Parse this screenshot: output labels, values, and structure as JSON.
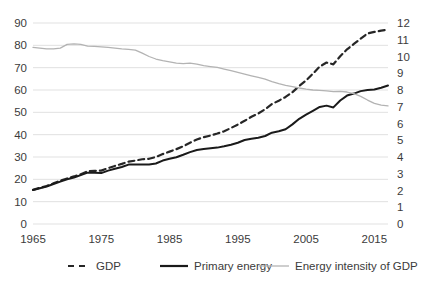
{
  "chart_data": {
    "type": "line",
    "title": "",
    "xlabel": "",
    "ylabel": "",
    "y2label": "",
    "grid": true,
    "legend_position": "bottom",
    "xlim": [
      1965,
      2017
    ],
    "ylim": [
      0,
      90
    ],
    "y2lim": [
      0,
      12
    ],
    "x_ticks": [
      "1965",
      "1975",
      "1985",
      "1995",
      "2005",
      "2015"
    ],
    "x_tick_values": [
      1965,
      1975,
      1985,
      1995,
      2005,
      2015
    ],
    "y_ticks": [
      "0",
      "10",
      "20",
      "30",
      "40",
      "50",
      "60",
      "70",
      "80",
      "90"
    ],
    "y_tick_values": [
      0,
      10,
      20,
      30,
      40,
      50,
      60,
      70,
      80,
      90
    ],
    "y2_ticks": [
      "0",
      "1",
      "2",
      "3",
      "4",
      "5",
      "6",
      "7",
      "8",
      "9",
      "10",
      "11",
      "12"
    ],
    "y2_tick_values": [
      0,
      1,
      2,
      3,
      4,
      5,
      6,
      7,
      8,
      9,
      10,
      11,
      12
    ],
    "x": [
      1965,
      1966,
      1967,
      1968,
      1969,
      1970,
      1971,
      1972,
      1973,
      1974,
      1975,
      1976,
      1977,
      1978,
      1979,
      1980,
      1981,
      1982,
      1983,
      1984,
      1985,
      1986,
      1987,
      1988,
      1989,
      1990,
      1991,
      1992,
      1993,
      1994,
      1995,
      1996,
      1997,
      1998,
      1999,
      2000,
      2001,
      2002,
      2003,
      2004,
      2005,
      2006,
      2007,
      2008,
      2009,
      2010,
      2011,
      2012,
      2013,
      2014,
      2015,
      2016,
      2017
    ],
    "series": [
      {
        "name": "GDP",
        "axis": "left",
        "style": "dashed",
        "color": "#262626",
        "values": [
          15.3,
          16.2,
          17.0,
          18.2,
          19.4,
          20.4,
          21.3,
          22.3,
          23.6,
          23.8,
          23.9,
          25.0,
          26.0,
          26.9,
          27.9,
          28.4,
          29.0,
          29.2,
          30.0,
          31.3,
          32.4,
          33.5,
          34.8,
          36.4,
          37.8,
          38.9,
          39.6,
          40.5,
          41.5,
          43.0,
          44.5,
          46.2,
          48.0,
          49.5,
          51.4,
          53.7,
          55.2,
          56.9,
          59.0,
          61.8,
          64.3,
          67.3,
          70.5,
          72.3,
          71.5,
          75.1,
          78.2,
          80.6,
          83.0,
          85.3,
          86.0,
          86.6,
          87.0
        ]
      },
      {
        "name": "Primary energy",
        "axis": "left",
        "style": "solid",
        "color": "#1a1a1a",
        "values": [
          15.2,
          16.0,
          16.8,
          17.9,
          19.0,
          20.0,
          20.8,
          21.9,
          23.0,
          23.0,
          22.8,
          23.9,
          24.7,
          25.5,
          26.6,
          26.6,
          26.6,
          26.6,
          27.1,
          28.4,
          29.2,
          29.9,
          31.0,
          32.2,
          33.1,
          33.6,
          33.9,
          34.2,
          34.8,
          35.5,
          36.4,
          37.6,
          38.2,
          38.6,
          39.4,
          40.9,
          41.5,
          42.4,
          44.6,
          47.1,
          49.0,
          50.7,
          52.4,
          53.0,
          52.2,
          55.3,
          57.5,
          58.4,
          59.5,
          60.0,
          60.2,
          61.0,
          62.0
        ]
      },
      {
        "name": "Energy intensity of GDP",
        "axis": "right",
        "style": "solid",
        "color": "#b3b3b3",
        "values": [
          10.55,
          10.5,
          10.45,
          10.45,
          10.5,
          10.72,
          10.75,
          10.72,
          10.62,
          10.6,
          10.58,
          10.55,
          10.5,
          10.45,
          10.42,
          10.38,
          10.2,
          10.0,
          9.85,
          9.75,
          9.68,
          9.6,
          9.58,
          9.6,
          9.55,
          9.45,
          9.4,
          9.35,
          9.25,
          9.15,
          9.05,
          8.95,
          8.85,
          8.75,
          8.65,
          8.5,
          8.38,
          8.28,
          8.2,
          8.12,
          8.05,
          8.0,
          7.98,
          7.95,
          7.9,
          7.92,
          7.88,
          7.78,
          7.62,
          7.4,
          7.2,
          7.1,
          7.05
        ]
      }
    ]
  },
  "legend": {
    "items": [
      {
        "label": "GDP",
        "style": "dashed",
        "color": "#262626"
      },
      {
        "label": "Primary energy",
        "style": "solid",
        "color": "#1a1a1a"
      },
      {
        "label": "Energy intensity of GDP",
        "style": "solid",
        "color": "#b3b3b3"
      }
    ]
  },
  "colors": {
    "background": "#ffffff",
    "gridline": "#d9d9d9",
    "text": "#3b3b3b",
    "gdp": "#262626",
    "primary_energy": "#1a1a1a",
    "energy_intensity": "#b3b3b3"
  }
}
